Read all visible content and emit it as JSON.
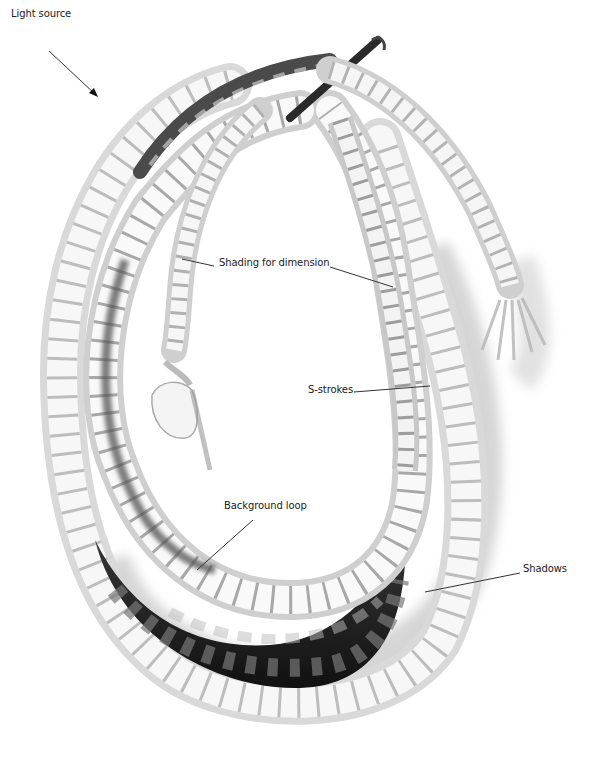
{
  "figure": {
    "colors": {
      "background": "#ffffff",
      "rope_light": "#f2f2f2",
      "rope_mid": "#bdbdbd",
      "rope_dark": "#2a2a2a",
      "shadow": "#9a9a9a",
      "leader_line": "#333333",
      "label_text": "#222222"
    }
  },
  "annotations": [
    {
      "id": "light-source",
      "text": "Light source",
      "x": 11,
      "y": 8
    },
    {
      "id": "shading-for-dimension",
      "text": "Shading for dimension",
      "x": 219,
      "y": 262
    },
    {
      "id": "s-strokes",
      "text": "S-strokes",
      "x": 308,
      "y": 387
    },
    {
      "id": "background-loop",
      "text": "Background loop",
      "x": 224,
      "y": 505
    },
    {
      "id": "shadows",
      "text": "Shadows",
      "x": 523,
      "y": 567
    }
  ]
}
